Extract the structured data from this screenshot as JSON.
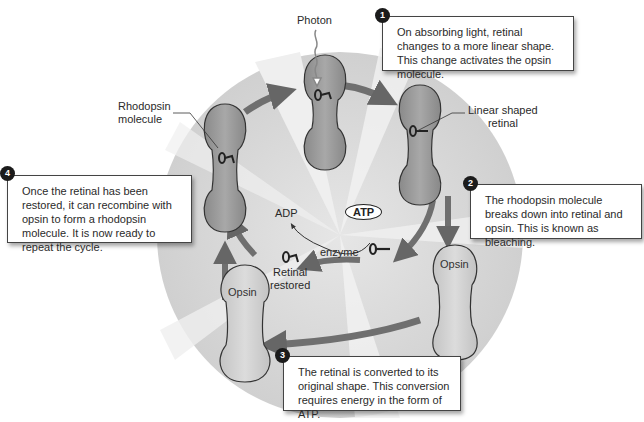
{
  "figure": {
    "title_cropped": "",
    "labels": {
      "photon": "Photon",
      "rhodopsin": "Rhodopsin\nmolecule",
      "rhodopsin_line1": "Rhodopsin",
      "rhodopsin_line2": "molecule",
      "linear_line1": "Linear shaped",
      "linear_line2": "retinal",
      "adp": "ADP",
      "atp": "ATP",
      "enzyme": "enzyme",
      "retinal_restored_line1": "Retinal",
      "retinal_restored_line2": "restored",
      "opsin_right": "Opsin",
      "opsin_left": "Opsin"
    },
    "steps": [
      {
        "number": "1",
        "text": "On absorbing light, retinal changes to a more linear shape. This change activates the opsin molecule."
      },
      {
        "number": "2",
        "text": "The rhodopsin molecule breaks down into retinal and opsin. This is known as bleaching."
      },
      {
        "number": "3",
        "text": "The retinal is converted to its original shape. This conversion requires energy in the form of ATP."
      },
      {
        "number": "4",
        "text": "Once the retinal has been restored, it can recombine with opsin to form a rhodopsin molecule. It is now ready to repeat the cycle."
      }
    ],
    "colors": {
      "background_circle": "#d9d9d9",
      "rhodopsin_fill": "#9a9a9a",
      "opsin_fill": "#cfcfcf",
      "arrow": "#7a7a7a",
      "badge": "#1b1b1b"
    }
  }
}
